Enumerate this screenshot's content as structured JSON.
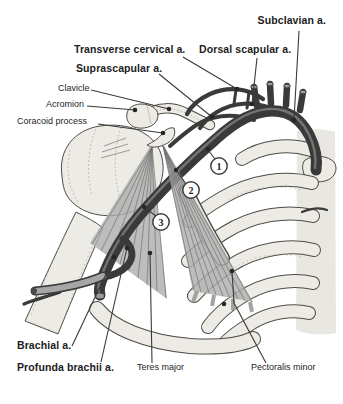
{
  "figure": {
    "labels": {
      "subclavian": "Subclavian a.",
      "transverse_cervical": "Transverse cervical a.",
      "dorsal_scapular": "Dorsal scapular a.",
      "suprascapular": "Suprascapular a.",
      "clavicle": "Clavicle",
      "acromion": "Acromion",
      "coracoid_process": "Coracoid process",
      "brachial": "Brachial a.",
      "profunda_brachii": "Profunda brachii a.",
      "teres_major": "Teres major",
      "pectoralis_minor": "Pectoralis minor"
    },
    "markers": {
      "part1": "1",
      "part2": "2",
      "part3": "3"
    },
    "colors": {
      "background": "#ffffff",
      "artery": "#3a3a3a",
      "artery_highlight": "#828282",
      "bone_fill": "#edebe5",
      "bone_outline": "#4f4c45",
      "muscle": "#aeaeae",
      "muscle_fiber": "#6f6f6f",
      "label_text": "#1c1c1c",
      "leader_line": "#3a3a3a"
    }
  }
}
